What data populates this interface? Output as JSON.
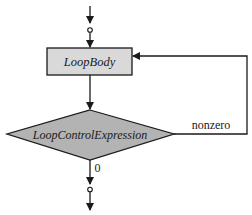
{
  "diagram": {
    "type": "flowchart",
    "title": "",
    "nodes": {
      "loop_body": {
        "label": "LoopBody",
        "shape": "rectangle",
        "fill": "#d9d9d9"
      },
      "loop_control": {
        "label": "LoopControlExpression",
        "shape": "diamond",
        "fill": "#b3b3b3"
      }
    },
    "edges": {
      "nonzero": {
        "label": "nonzero",
        "from": "loop_control",
        "to": "loop_body"
      },
      "zero": {
        "label": "0",
        "from": "loop_control",
        "to": "exit"
      }
    },
    "colors": {
      "stroke": "#1a1a1a",
      "box_fill": "#d9d9d9",
      "diamond_fill": "#b3b3b3",
      "background": "#ffffff"
    }
  }
}
